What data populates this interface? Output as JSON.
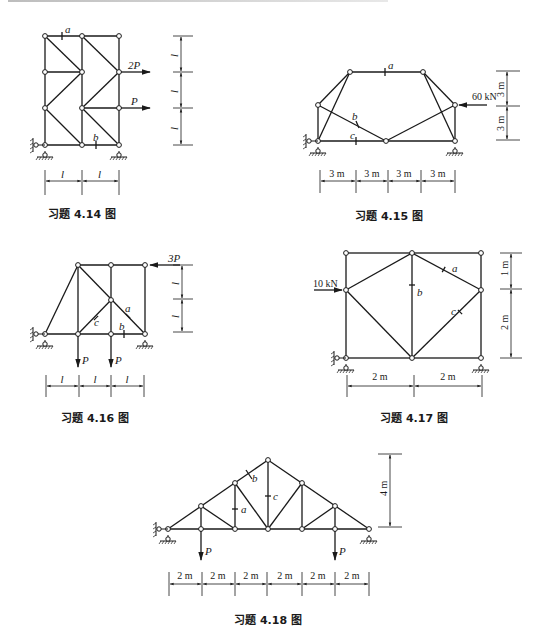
{
  "figures": [
    {
      "id": "4.14",
      "caption": "习题 4.14 图",
      "member_labels": [
        "a",
        "b"
      ],
      "loads": [
        {
          "label": "2P",
          "direction": "right"
        },
        {
          "label": "P",
          "direction": "right"
        }
      ],
      "horizontal_dims": [
        "l",
        "l"
      ],
      "vertical_dims": [
        "l",
        "l",
        "l"
      ]
    },
    {
      "id": "4.15",
      "caption": "习题 4.15 图",
      "member_labels": [
        "a",
        "b",
        "c"
      ],
      "loads": [
        {
          "label": "60 kN",
          "direction": "left"
        }
      ],
      "horizontal_dims": [
        "3 m",
        "3 m",
        "3 m",
        "3 m"
      ],
      "vertical_dims": [
        "3 m",
        "3 m"
      ]
    },
    {
      "id": "4.16",
      "caption": "习题 4.16 图",
      "member_labels": [
        "a",
        "b",
        "c"
      ],
      "loads": [
        {
          "label": "3P",
          "direction": "left"
        },
        {
          "label": "P",
          "direction": "down"
        },
        {
          "label": "P",
          "direction": "down"
        }
      ],
      "horizontal_dims": [
        "l",
        "l",
        "l"
      ],
      "vertical_dims": [
        "l",
        "l"
      ]
    },
    {
      "id": "4.17",
      "caption": "习题 4.17 图",
      "member_labels": [
        "a",
        "b",
        "c"
      ],
      "loads": [
        {
          "label": "10 kN",
          "direction": "right"
        }
      ],
      "horizontal_dims": [
        "2 m",
        "2 m"
      ],
      "vertical_dims": [
        "1 m",
        "2 m"
      ]
    },
    {
      "id": "4.18",
      "caption": "习题 4.18 图",
      "member_labels": [
        "a",
        "b",
        "c"
      ],
      "loads": [
        {
          "label": "P",
          "direction": "down"
        },
        {
          "label": "P",
          "direction": "down"
        }
      ],
      "horizontal_dims": [
        "2 m",
        "2 m",
        "2 m",
        "2 m",
        "2 m",
        "2 m"
      ],
      "vertical_dims": [
        "4 m"
      ]
    }
  ]
}
